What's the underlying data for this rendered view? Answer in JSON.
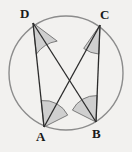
{
  "figure": {
    "background_color": "#f2f1ef",
    "width": 132,
    "height": 152
  },
  "circle": {
    "name": "circumcircle",
    "cx": 66,
    "cy": 73,
    "r": 57,
    "stroke_color": "#8c8c8c",
    "stroke_width": 1.4,
    "fill": "none"
  },
  "points": [
    {
      "id": "D",
      "label": "D",
      "x": 33,
      "y": 23,
      "label_x": 20,
      "label_y": 7
    },
    {
      "id": "C",
      "label": "C",
      "x": 100,
      "y": 25,
      "label_x": 100,
      "label_y": 8
    },
    {
      "id": "A",
      "label": "A",
      "x": 44,
      "y": 127,
      "label_x": 36,
      "label_y": 130
    },
    {
      "id": "B",
      "label": "B",
      "x": 96,
      "y": 122,
      "label_x": 92,
      "label_y": 127
    }
  ],
  "segments": [
    {
      "id": "DA",
      "from": "D",
      "to": "A",
      "x1": 33,
      "y1": 23,
      "x2": 44,
      "y2": 127
    },
    {
      "id": "CB",
      "from": "C",
      "to": "B",
      "x1": 100,
      "y1": 25,
      "x2": 96,
      "y2": 122
    },
    {
      "id": "DB",
      "from": "D",
      "to": "B",
      "x1": 33,
      "y1": 23,
      "x2": 96,
      "y2": 122
    },
    {
      "id": "CA",
      "from": "C",
      "to": "A",
      "x1": 100,
      "y1": 25,
      "x2": 44,
      "y2": 127
    }
  ],
  "segment_style": {
    "stroke_color": "#2b2b2b",
    "stroke_width": 1.3
  },
  "intersection": {
    "id": "X",
    "x": 70,
    "y": 77,
    "label": ""
  },
  "angle_marks": [
    {
      "id": "angle-D",
      "at": "D",
      "between": [
        "DA",
        "DB"
      ],
      "path": "M 33 23 L 36.3 54.2 A 31.3 31.3 0 0 1 57.2 41.1 Z",
      "fill": "#cfcfcf",
      "stroke": "#6f6f6f"
    },
    {
      "id": "angle-C",
      "at": "C",
      "between": [
        "CB",
        "CA"
      ],
      "path": "M 100 25 L 98.9 54.1 A 29.1 29.1 0 0 1 83.7 48.4 Z",
      "fill": "#cfcfcf",
      "stroke": "#6f6f6f"
    },
    {
      "id": "angle-A",
      "at": "A",
      "between": [
        "AD",
        "AC"
      ],
      "path": "M 44 127 L 41.2 100.6 A 26.5 26.5 0 0 1 67.7 115.1 Z",
      "fill": "#cfcfcf",
      "stroke": "#6f6f6f"
    },
    {
      "id": "angle-B",
      "at": "B",
      "between": [
        "BC",
        "BD"
      ],
      "path": "M 96 122 L 72.4 110.1 A 26.4 26.4 0 0 1 97.1 95.6 Z",
      "fill": "#cfcfcf",
      "stroke": "#6f6f6f"
    }
  ]
}
